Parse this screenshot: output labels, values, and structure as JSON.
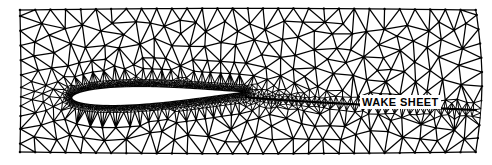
{
  "figure": {
    "width": 492,
    "height": 165,
    "background_color": "#ffffff",
    "mesh_color": "#000000",
    "body_color": "#ffffff"
  },
  "annotations": [
    {
      "id": "wake-sheet",
      "text": "WAKE SHEET",
      "x": 360,
      "y": 95,
      "font_size": 11,
      "bold": true,
      "color": "#000000",
      "background": "#ffffff"
    }
  ],
  "chart_data": {
    "type": "mesh",
    "xlabel": "",
    "ylabel": "",
    "grid": false,
    "legend": "none",
    "domain": {
      "left": 20,
      "right": 476,
      "top": 10,
      "bottom": 152,
      "left_bulge": 4,
      "right_bulge": 6,
      "top_bulge": 3,
      "bottom_bulge": 3
    },
    "airfoil": {
      "name": "symmetric-airfoil",
      "leading_edge_x": 72,
      "trailing_edge_x": 246,
      "chord": 174,
      "center_y": 95,
      "max_thickness": 18,
      "max_thickness_position": 0.34,
      "angle_of_attack_deg": 3.5,
      "fill": "#ffffff",
      "outline": "#000000"
    },
    "wake": {
      "start_x": 246,
      "start_y": 97,
      "end_x": 476,
      "end_y": 110,
      "line_width": 2.2,
      "color": "#000000"
    },
    "refinement": {
      "far_field_spacing": 15.5,
      "near_body_spacing": 1.05,
      "wake_spacing": 4.2,
      "boundary_layer_bands": 9,
      "growth_rate": 1.26,
      "node_count_estimate": 4200,
      "triangle_count_estimate": 8100
    },
    "style": {
      "edge_width_far": 1.25,
      "edge_width_near": 0.55,
      "node_dot_radius_far": 1.25,
      "node_dot_radius_near": 0.0
    }
  }
}
